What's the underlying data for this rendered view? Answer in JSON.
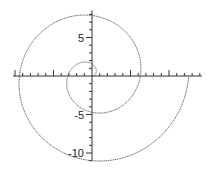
{
  "chart_data": {
    "type": "line",
    "title": "",
    "xlabel": "",
    "ylabel": "",
    "equation": "r = theta",
    "theta_range": [
      0,
      12.566
    ],
    "xlim": [
      -10,
      14
    ],
    "ylim": [
      -11,
      8.5
    ],
    "grid": false,
    "y_tick_labels": [
      "5",
      "-5",
      "-10"
    ],
    "y_tick_values": [
      5,
      -5,
      -10
    ],
    "line_color": "#444444",
    "line_style": "dotted-thin"
  }
}
